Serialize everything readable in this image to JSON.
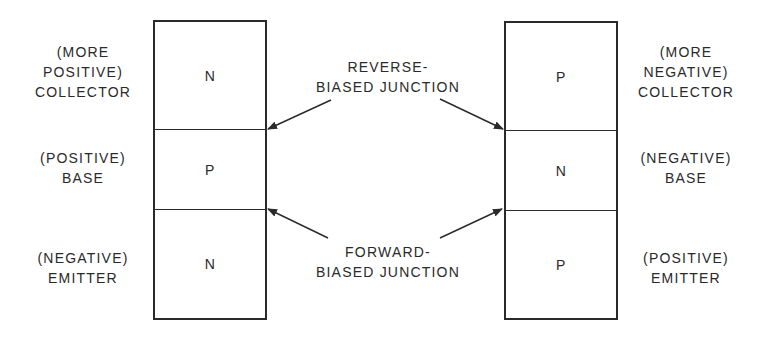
{
  "colors": {
    "ink": "#2a2a2a",
    "background": "#ffffff"
  },
  "npn": {
    "regions": [
      {
        "name": "collector",
        "type": "N"
      },
      {
        "name": "base",
        "type": "P"
      },
      {
        "name": "emitter",
        "type": "N"
      }
    ],
    "labels": {
      "collector": [
        "(MORE",
        "POSITIVE)",
        "COLLECTOR"
      ],
      "base": [
        "(POSITIVE)",
        "BASE"
      ],
      "emitter": [
        "(NEGATIVE)",
        "EMITTER"
      ]
    }
  },
  "pnp": {
    "regions": [
      {
        "name": "collector",
        "type": "P"
      },
      {
        "name": "base",
        "type": "N"
      },
      {
        "name": "emitter",
        "type": "P"
      }
    ],
    "labels": {
      "collector": [
        "(MORE",
        "NEGATIVE)",
        "COLLECTOR"
      ],
      "base": [
        "(NEGATIVE)",
        "BASE"
      ],
      "emitter": [
        "(POSITIVE)",
        "EMITTER"
      ]
    }
  },
  "annotations": {
    "reverse": [
      "REVERSE-",
      "BIASED JUNCTION"
    ],
    "forward": [
      "FORWARD-",
      "BIASED JUNCTION"
    ]
  }
}
